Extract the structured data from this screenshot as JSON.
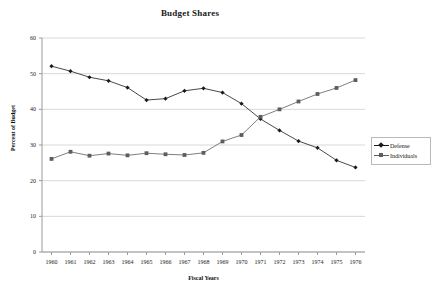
{
  "chart_data": {
    "type": "line",
    "title": "Budget Shares",
    "xlabel": "Fiscal Years",
    "ylabel": "Percent of Budget",
    "x": [
      "1960",
      "1961",
      "1962",
      "1963",
      "1964",
      "1965",
      "1966",
      "1967",
      "1968",
      "1969",
      "1970",
      "1971",
      "1972",
      "1973",
      "1974",
      "1975",
      "1976"
    ],
    "xtick_labels": [
      "1960",
      "1961",
      "1962",
      "1963",
      "1964",
      "1965",
      "1966",
      "1967",
      "1968",
      "1969",
      "1970",
      "1971",
      "1972",
      "1973",
      "1974",
      "1975",
      "1976"
    ],
    "ytick_labels": [
      "0",
      "10",
      "20",
      "30",
      "40",
      "50",
      "60"
    ],
    "yticks": [
      0,
      10,
      20,
      30,
      40,
      50,
      60
    ],
    "ylim": [
      0,
      60
    ],
    "grid": "horizontal",
    "legend_position": "right",
    "series": [
      {
        "name": "Defense",
        "marker": "diamond",
        "color": "#1a1a1a",
        "values": [
          52.1,
          50.7,
          49.0,
          48.0,
          46.1,
          42.6,
          43.0,
          45.2,
          45.9,
          44.7,
          41.6,
          37.3,
          34.1,
          31.1,
          29.2,
          25.7,
          23.7
        ]
      },
      {
        "name": "Individuals",
        "marker": "square",
        "color": "#5d5d5d",
        "values": [
          26.1,
          28.1,
          27.0,
          27.6,
          27.1,
          27.7,
          27.4,
          27.2,
          27.8,
          31.0,
          32.8,
          37.9,
          40.0,
          42.2,
          44.3,
          46.0,
          48.2
        ]
      }
    ]
  },
  "legend": {
    "items": [
      {
        "label": "Defense"
      },
      {
        "label": "Individuals"
      }
    ]
  }
}
